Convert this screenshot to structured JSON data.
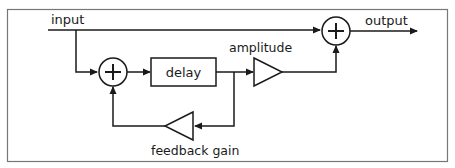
{
  "diagram": {
    "type": "signal-flow block diagram (feedforward comb / echo with feedback)",
    "colors": {
      "stroke": "#1a1a1a",
      "frame": "#777777",
      "background": "#ffffff"
    },
    "labels": {
      "input": "input",
      "output": "output",
      "delay": "delay",
      "amplitude": "amplitude",
      "feedback_gain": "feedback gain",
      "sum_symbol": "+"
    },
    "nodes": [
      {
        "id": "input",
        "kind": "terminal",
        "label": "input"
      },
      {
        "id": "sum1",
        "kind": "summer",
        "label": "+"
      },
      {
        "id": "delay",
        "kind": "block",
        "label": "delay"
      },
      {
        "id": "amp",
        "kind": "gain",
        "label": "amplitude"
      },
      {
        "id": "fb",
        "kind": "gain",
        "label": "feedback gain"
      },
      {
        "id": "sum2",
        "kind": "summer",
        "label": "+"
      },
      {
        "id": "output",
        "kind": "terminal",
        "label": "output"
      }
    ],
    "edges": [
      {
        "from": "input",
        "to": "sum2"
      },
      {
        "from": "input",
        "to": "sum1"
      },
      {
        "from": "sum1",
        "to": "delay"
      },
      {
        "from": "delay",
        "to": "amp"
      },
      {
        "from": "delay",
        "to": "fb"
      },
      {
        "from": "fb",
        "to": "sum1"
      },
      {
        "from": "amp",
        "to": "sum2"
      },
      {
        "from": "sum2",
        "to": "output"
      }
    ]
  }
}
